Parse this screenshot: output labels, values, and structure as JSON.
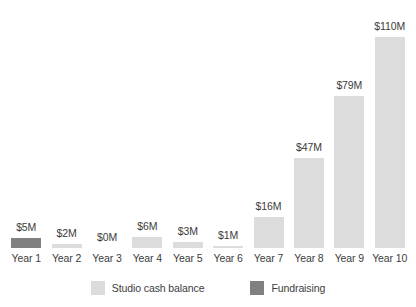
{
  "chart_data": {
    "type": "bar",
    "title": "",
    "subtitle": "",
    "xlabel": "",
    "ylabel": "",
    "ylim": [
      0,
      110
    ],
    "grid": false,
    "legend_position": "bottom",
    "categories": [
      "Year 1",
      "Year 2",
      "Year 3",
      "Year 4",
      "Year 5",
      "Year 6",
      "Year 7",
      "Year 8",
      "Year 9",
      "Year 10"
    ],
    "values": [
      5,
      2,
      0,
      6,
      3,
      1,
      16,
      47,
      79,
      110
    ],
    "data_labels": [
      "$5M",
      "$2M",
      "$0M",
      "$6M",
      "$3M",
      "$1M",
      "$16M",
      "$47M",
      "$79M",
      "$110M"
    ],
    "series_of_bar": [
      "Fundraising",
      "Studio cash balance",
      "Studio cash balance",
      "Studio cash balance",
      "Studio cash balance",
      "Studio cash balance",
      "Studio cash balance",
      "Studio cash balance",
      "Studio cash balance",
      "Studio cash balance"
    ],
    "series": [
      {
        "name": "Studio cash balance",
        "color": "#dcdcdc",
        "values": [
          null,
          2,
          0,
          6,
          3,
          1,
          16,
          47,
          79,
          110
        ]
      },
      {
        "name": "Fundraising",
        "color": "#808080",
        "values": [
          5,
          null,
          null,
          null,
          null,
          null,
          null,
          null,
          null,
          null
        ]
      }
    ]
  },
  "clipped_top_text": "",
  "legend": {
    "items": [
      {
        "label": "Studio cash balance",
        "color": "#dcdcdc"
      },
      {
        "label": "Fundraising",
        "color": "#808080"
      }
    ]
  },
  "colors": {
    "studio_cash_balance": "#dcdcdc",
    "fundraising": "#808080",
    "text": "#3c3c3c",
    "background": "#ffffff"
  }
}
